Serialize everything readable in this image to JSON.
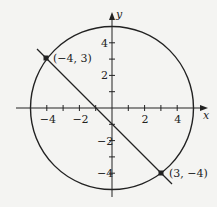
{
  "diagram": {
    "axes": {
      "x_label": "x",
      "y_label": "y"
    },
    "x_ticks": [
      {
        "v": -4,
        "t": "-4"
      },
      {
        "v": -2,
        "t": "-2"
      },
      {
        "v": 2,
        "t": "2"
      },
      {
        "v": 4,
        "t": "4"
      }
    ],
    "y_ticks": [
      {
        "v": 4,
        "t": "4"
      },
      {
        "v": 2,
        "t": "2"
      },
      {
        "v": -2,
        "t": "-2"
      },
      {
        "v": -4,
        "t": "-4"
      }
    ],
    "circle": {
      "center": [
        0,
        0
      ],
      "radius": 5
    },
    "line": {
      "through": [
        [
          -4,
          3
        ],
        [
          3,
          -4
        ]
      ]
    },
    "points": [
      {
        "x": -4,
        "y": 3,
        "label": "(−4, 3)"
      },
      {
        "x": 3,
        "y": -4,
        "label": "(3, −4)"
      }
    ],
    "colors": {
      "stroke": "#222222",
      "background": "#f4f4f2"
    }
  }
}
